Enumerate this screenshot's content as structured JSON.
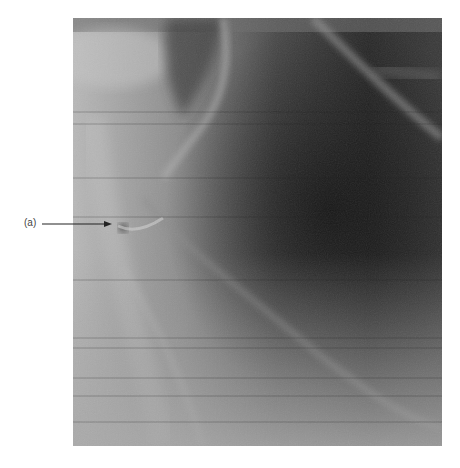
{
  "figure": {
    "type": "radiograph",
    "annotations": [
      {
        "label": "(a)",
        "arrow_direction": "right",
        "label_position": [
          24,
          217
        ],
        "arrow_tip": [
          112,
          224
        ]
      }
    ]
  },
  "colors": {
    "background": "#ffffff",
    "arrow": "#222222",
    "label_text": "#444444"
  }
}
